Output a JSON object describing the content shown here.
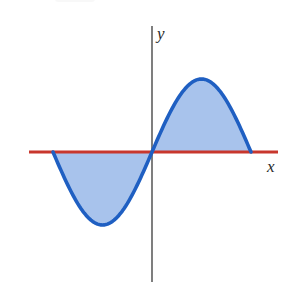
{
  "figure": {
    "xlabel": "x",
    "ylabel": "y",
    "colors": {
      "curve": "#1f5fc2",
      "fill": "#a8c3ec",
      "x_axis": "#c8372d",
      "y_axis": "#3a3a3a"
    }
  },
  "chart_data": {
    "type": "area",
    "title": "",
    "xlabel": "x",
    "ylabel": "y",
    "function": "y = sin(x)",
    "xlim": [
      -3.14159,
      3.14159
    ],
    "ylim": [
      -1,
      1
    ],
    "grid": false,
    "legend": null,
    "x": [
      -3.14,
      -2.36,
      -1.57,
      -0.79,
      0,
      0.79,
      1.57,
      2.36,
      3.14
    ],
    "series": [
      {
        "name": "curve",
        "values": [
          0,
          -0.71,
          -1,
          -0.71,
          0,
          0.71,
          1,
          0.71,
          0
        ]
      }
    ],
    "shaded_regions": [
      {
        "from": -3.14159,
        "to": 0,
        "sign": "negative"
      },
      {
        "from": 0,
        "to": 3.14159,
        "sign": "positive"
      }
    ]
  }
}
